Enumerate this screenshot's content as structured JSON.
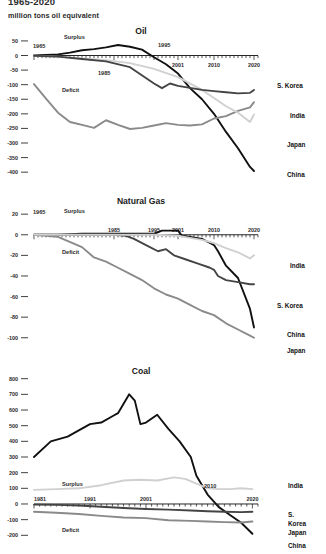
{
  "header": {
    "title": "1965-2020",
    "subtitle": "million tons oil equivalent"
  },
  "labels": {
    "surplus": "Surplus",
    "deficit": "Deficit"
  },
  "colors": {
    "china": "#111111",
    "s_korea": "#444444",
    "japan": "#8a8a8a",
    "india": "#d0d0d0",
    "axis": "#111111",
    "text": "#2b2b2b"
  },
  "chart_data": [
    {
      "type": "line",
      "title": "Oil",
      "xlabel": "",
      "ylabel": "",
      "ylim": [
        -420,
        60
      ],
      "xlim": [
        1965,
        2021
      ],
      "grid": false,
      "legend_position": "right",
      "yticks": [
        50,
        0,
        -50,
        -100,
        -150,
        -200,
        -250,
        -300,
        -350,
        -400
      ],
      "ytick_labels": [
        "50",
        "0",
        "-50",
        "-100",
        "-150",
        "-200",
        "-250",
        "-300",
        "-350",
        "-400"
      ],
      "xticks": [
        1965,
        1985,
        1995,
        2001,
        2010,
        2020
      ],
      "xtick_labels": [
        "1965",
        "1985",
        "1995",
        "2001",
        "2010",
        "2020"
      ],
      "annotations": [
        "Surplus",
        "Deficit"
      ],
      "series": [
        {
          "name": "China",
          "color": "#111111",
          "x": [
            1965,
            1968,
            1971,
            1974,
            1977,
            1980,
            1983,
            1986,
            1989,
            1992,
            1995,
            1998,
            2001,
            2004,
            2007,
            2010,
            2013,
            2016,
            2019,
            2020
          ],
          "values": [
            0,
            2,
            4,
            10,
            18,
            22,
            28,
            36,
            30,
            20,
            -6,
            -30,
            -62,
            -112,
            -150,
            -200,
            -262,
            -318,
            -382,
            -396
          ]
        },
        {
          "name": "Japan",
          "color": "#8a8a8a",
          "x": [
            1965,
            1968,
            1971,
            1974,
            1977,
            1980,
            1983,
            1986,
            1989,
            1992,
            1995,
            1998,
            2001,
            2004,
            2007,
            2010,
            2013,
            2016,
            2019,
            2020
          ],
          "values": [
            -98,
            -148,
            -196,
            -228,
            -238,
            -248,
            -222,
            -238,
            -252,
            -248,
            -240,
            -232,
            -238,
            -240,
            -236,
            -216,
            -208,
            -190,
            -178,
            -160
          ]
        },
        {
          "name": "India",
          "color": "#d0d0d0",
          "x": [
            1965,
            1971,
            1977,
            1983,
            1989,
            1995,
            2001,
            2007,
            2010,
            2013,
            2016,
            2019,
            2020
          ],
          "values": [
            -1,
            -4,
            -10,
            -16,
            -26,
            -46,
            -74,
            -118,
            -146,
            -174,
            -196,
            -228,
            -202
          ]
        },
        {
          "name": "S. Korea",
          "color": "#444444",
          "x": [
            1965,
            1971,
            1977,
            1983,
            1989,
            1995,
            1997,
            1999,
            2001,
            2007,
            2010,
            2013,
            2016,
            2019,
            2020
          ],
          "values": [
            -1,
            -4,
            -12,
            -20,
            -40,
            -96,
            -112,
            -96,
            -104,
            -118,
            -122,
            -126,
            -130,
            -128,
            -118
          ]
        }
      ]
    },
    {
      "type": "line",
      "title": "Natural Gas",
      "xlabel": "",
      "ylabel": "",
      "ylim": [
        -108,
        26
      ],
      "xlim": [
        1965,
        2021
      ],
      "grid": false,
      "legend_position": "right",
      "yticks": [
        20,
        0,
        -20,
        -40,
        -60,
        -80,
        -100
      ],
      "ytick_labels": [
        "20",
        "0",
        "-20",
        "-40",
        "-60",
        "-80",
        "-100"
      ],
      "xticks": [
        1965,
        1985,
        1995,
        2001,
        2010,
        2020
      ],
      "xtick_labels": [
        "1965",
        "1985",
        "1995",
        "2001",
        "2010",
        "2020"
      ],
      "annotations": [
        "Surplus",
        "Deficit"
      ],
      "series": [
        {
          "name": "China",
          "color": "#111111",
          "x": [
            1965,
            1971,
            1977,
            1983,
            1989,
            1992,
            1995,
            1997,
            1999,
            2001,
            2002,
            2004,
            2007,
            2009,
            2010,
            2011,
            2013,
            2016,
            2019,
            2020
          ],
          "values": [
            0,
            0,
            1,
            1,
            1,
            1,
            1,
            4,
            4,
            4,
            -1,
            -2,
            -4,
            -8,
            -10,
            -16,
            -30,
            -42,
            -72,
            -90
          ]
        },
        {
          "name": "Japan",
          "color": "#8a8a8a",
          "x": [
            1965,
            1971,
            1977,
            1980,
            1983,
            1986,
            1989,
            1992,
            1995,
            1998,
            2001,
            2004,
            2007,
            2010,
            2013,
            2016,
            2019,
            2020
          ],
          "values": [
            0,
            -2,
            -12,
            -22,
            -26,
            -32,
            -38,
            -44,
            -52,
            -58,
            -62,
            -68,
            -74,
            -78,
            -86,
            -92,
            -98,
            -100
          ]
        },
        {
          "name": "S. Korea",
          "color": "#444444",
          "x": [
            1965,
            1977,
            1985,
            1988,
            1990,
            1993,
            1996,
            1998,
            2000,
            2003,
            2006,
            2009,
            2010,
            2011,
            2013,
            2016,
            2019,
            2020
          ],
          "values": [
            0,
            0,
            0,
            -1,
            -4,
            -10,
            -16,
            -14,
            -20,
            -24,
            -28,
            -32,
            -34,
            -40,
            -44,
            -46,
            -48,
            -48
          ]
        },
        {
          "name": "India",
          "color": "#d0d0d0",
          "x": [
            1965,
            1985,
            1995,
            2001,
            2004,
            2007,
            2010,
            2013,
            2016,
            2019,
            2020
          ],
          "values": [
            0,
            0,
            0,
            -1,
            -3,
            -5,
            -8,
            -13,
            -17,
            -23,
            -20
          ]
        }
      ]
    },
    {
      "type": "line",
      "title": "Coal",
      "xlabel": "",
      "ylabel": "",
      "ylim": [
        -230,
        830
      ],
      "xlim": [
        1981,
        2021
      ],
      "grid": false,
      "legend_position": "right",
      "yticks": [
        800,
        700,
        600,
        500,
        400,
        300,
        200,
        100,
        0,
        -100,
        -200
      ],
      "ytick_labels": [
        "800",
        "700",
        "600",
        "500",
        "400",
        "300",
        "200",
        "100",
        "0",
        "-100",
        "-200"
      ],
      "xticks": [
        1981,
        1991,
        2001,
        2020
      ],
      "xtick_labels": [
        "1981",
        "1991",
        "2001",
        "2020"
      ],
      "annotations": [
        "Surplus",
        "Deficit",
        "2010"
      ],
      "series": [
        {
          "name": "China",
          "color": "#111111",
          "x": [
            1981,
            1984,
            1987,
            1989,
            1991,
            1993,
            1995,
            1996,
            1997,
            1998,
            1999,
            2000,
            2001,
            2003,
            2005,
            2007,
            2009,
            2010,
            2012,
            2014,
            2016,
            2018,
            2020
          ],
          "values": [
            300,
            400,
            430,
            470,
            510,
            520,
            560,
            580,
            640,
            700,
            660,
            510,
            520,
            570,
            480,
            400,
            300,
            180,
            60,
            -20,
            -70,
            -120,
            -190
          ]
        },
        {
          "name": "India",
          "color": "#d0d0d0",
          "x": [
            1981,
            1985,
            1989,
            1993,
            1997,
            2000,
            2003,
            2006,
            2008,
            2010,
            2012,
            2014,
            2016,
            2018,
            2020
          ],
          "values": [
            90,
            95,
            100,
            120,
            150,
            155,
            150,
            170,
            160,
            130,
            100,
            95,
            95,
            100,
            95
          ]
        },
        {
          "name": "S. Korea",
          "color": "#444444",
          "x": [
            1981,
            1985,
            1989,
            1993,
            1997,
            2001,
            2005,
            2009,
            2012,
            2015,
            2018,
            2020
          ],
          "values": [
            -4,
            -6,
            -10,
            -18,
            -26,
            -32,
            -36,
            -42,
            -46,
            -50,
            -52,
            -50
          ]
        },
        {
          "name": "Japan",
          "color": "#8a8a8a",
          "x": [
            1981,
            1985,
            1989,
            1993,
            1997,
            2001,
            2005,
            2009,
            2012,
            2015,
            2018,
            2020
          ],
          "values": [
            -50,
            -56,
            -64,
            -76,
            -86,
            -90,
            -104,
            -108,
            -112,
            -116,
            -118,
            -112
          ]
        }
      ]
    }
  ]
}
